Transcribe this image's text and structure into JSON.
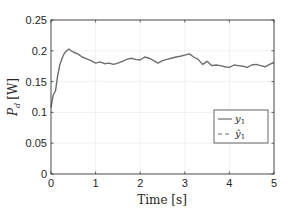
{
  "chart_data": {
    "type": "line",
    "title": "",
    "xlabel": "Time [s]",
    "ylabel": "P_d [W]",
    "ylabel_main": "P",
    "ylabel_sub": "d",
    "ylabel_unit": "[W]",
    "xlim": [
      0,
      5
    ],
    "ylim": [
      0,
      0.25
    ],
    "grid": true,
    "legend_position": "right-center",
    "x_ticks": [
      "0",
      "1",
      "2",
      "3",
      "4",
      "5"
    ],
    "y_ticks": [
      "0",
      "0.05",
      "0.1",
      "0.15",
      "0.2",
      "0.25"
    ],
    "series": [
      {
        "name": "y1",
        "legend_label": "y",
        "legend_sub": "1",
        "style": "solid",
        "color": "#6e6e6e",
        "x": [
          0,
          0.05,
          0.1,
          0.15,
          0.2,
          0.25,
          0.3,
          0.35,
          0.4,
          0.45,
          0.5,
          0.6,
          0.7,
          0.8,
          0.9,
          1.0,
          1.1,
          1.2,
          1.3,
          1.4,
          1.5,
          1.6,
          1.7,
          1.8,
          1.9,
          2.0,
          2.1,
          2.2,
          2.3,
          2.4,
          2.5,
          2.6,
          2.7,
          2.8,
          2.9,
          3.0,
          3.1,
          3.2,
          3.3,
          3.4,
          3.5,
          3.6,
          3.7,
          3.8,
          3.9,
          4.0,
          4.1,
          4.2,
          4.3,
          4.4,
          4.5,
          4.6,
          4.7,
          4.8,
          4.9,
          5.0
        ],
        "y": [
          0.108,
          0.128,
          0.135,
          0.16,
          0.178,
          0.188,
          0.196,
          0.2,
          0.203,
          0.2,
          0.198,
          0.195,
          0.19,
          0.187,
          0.184,
          0.18,
          0.182,
          0.179,
          0.18,
          0.178,
          0.18,
          0.183,
          0.186,
          0.188,
          0.186,
          0.185,
          0.19,
          0.188,
          0.184,
          0.18,
          0.184,
          0.186,
          0.188,
          0.19,
          0.191,
          0.193,
          0.195,
          0.19,
          0.186,
          0.178,
          0.183,
          0.176,
          0.177,
          0.176,
          0.174,
          0.173,
          0.177,
          0.176,
          0.175,
          0.173,
          0.177,
          0.178,
          0.176,
          0.174,
          0.178,
          0.181
        ]
      },
      {
        "name": "y1_hat",
        "legend_label": "ŷ",
        "legend_sub": "1",
        "style": "dashed",
        "color": "#6e6e6e",
        "x": [],
        "y": []
      }
    ]
  },
  "colors": {
    "axis": "#262626",
    "grid": "#ebebeb",
    "line": "#6e6e6e",
    "background": "#ffffff"
  }
}
